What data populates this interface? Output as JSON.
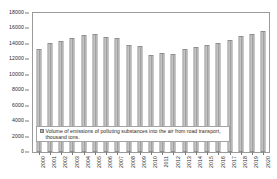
{
  "chart_data": {
    "type": "bar",
    "title": "",
    "xlabel": "",
    "ylabel": "",
    "ylim": [
      0,
      18000
    ],
    "ytick_step": 2000,
    "grid": false,
    "legend_position": "inside-bottom-left",
    "series_name": "Volume of emissions of polluting substances into the air from road transport, thousand tons.",
    "categories": [
      "2000",
      "2001",
      "2002",
      "2003",
      "2004",
      "2005",
      "2006",
      "2007",
      "2008",
      "2009",
      "2010",
      "2011",
      "2012",
      "2013",
      "2014",
      "2015",
      "2016",
      "2017",
      "2018",
      "2019",
      "2020"
    ],
    "values": [
      13370,
      14080,
      14430,
      14760,
      15180,
      15340,
      14890,
      14820,
      13800,
      13740,
      12560,
      12770,
      12640,
      13340,
      13600,
      13800,
      14080,
      14450,
      15060,
      15300,
      15640
    ],
    "ytick_labels": [
      "0",
      "2000",
      "4000",
      "6000",
      "8000",
      "10000",
      "12000",
      "14000",
      "16000",
      "18000"
    ],
    "bar_color": "#b0b0b0",
    "frame_color": "#9a9a9a",
    "text_color": "#2b2b2b"
  },
  "legend": {
    "marker": "legend-swatch-icon",
    "label": "Volume of emissions of polluting substances into the air from road transport, thousand tons."
  }
}
